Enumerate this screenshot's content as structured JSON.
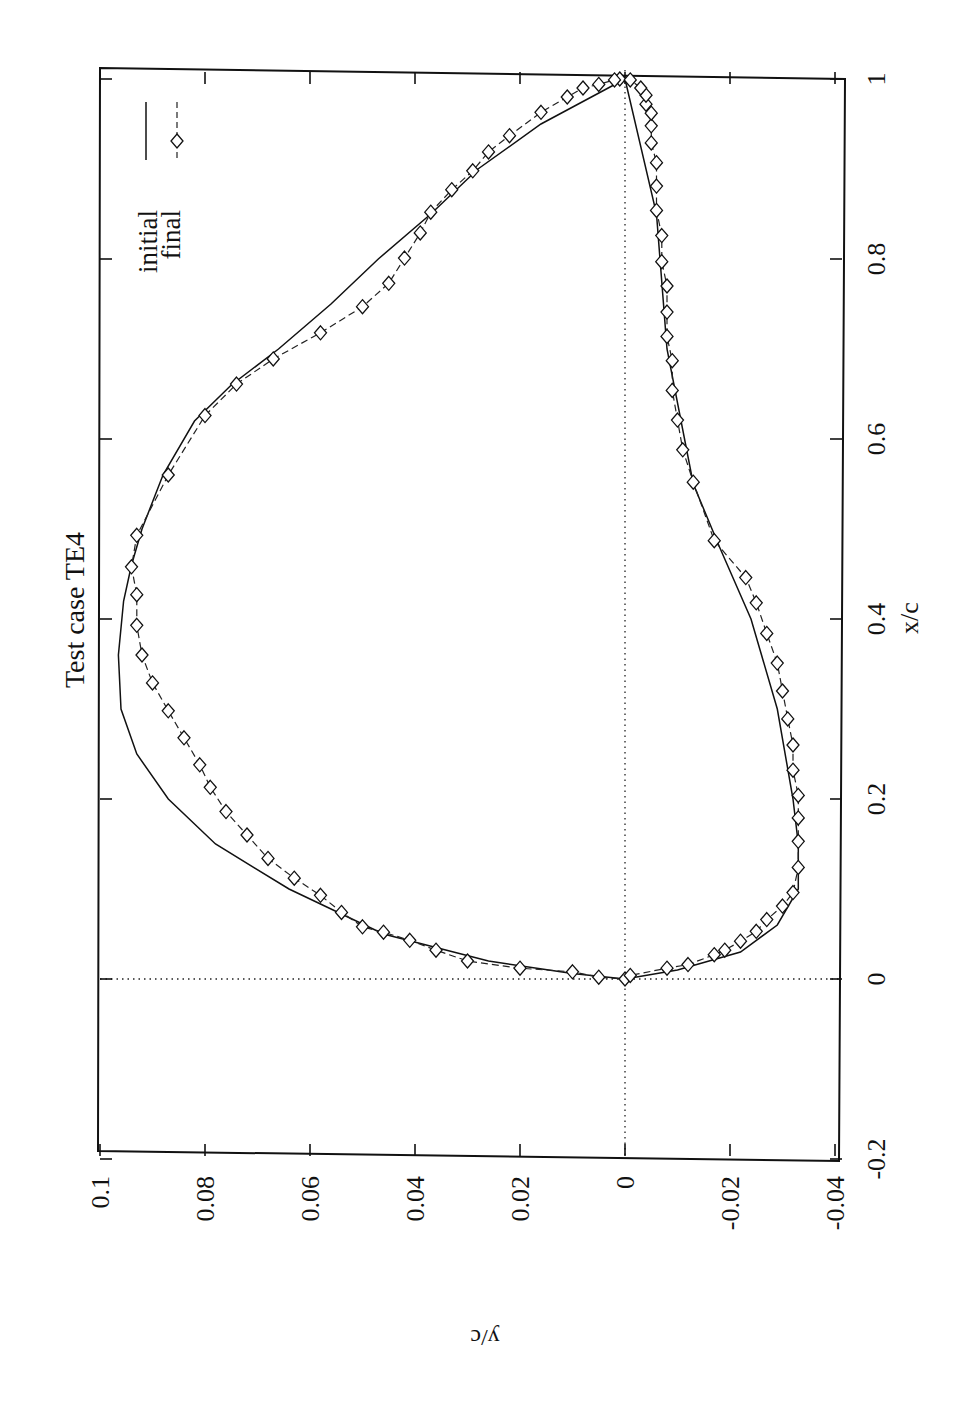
{
  "chart_data": {
    "type": "line",
    "title": "Test case TE4",
    "xlabel": "x/c",
    "ylabel": "y/c",
    "orientation_note": "page is rotated 90 degrees; x/c axis runs vertically on the right edge, y/c axis along the bottom",
    "xlim": [
      -0.2,
      1.0
    ],
    "ylim": [
      -0.04,
      0.1
    ],
    "x_ticks": [
      "-0.2",
      "0",
      "0.2",
      "0.4",
      "0.6",
      "0.8",
      "1"
    ],
    "y_ticks": [
      "0.1",
      "0.08",
      "0.06",
      "0.04",
      "0.02",
      "0",
      "-0.02",
      "-0.04"
    ],
    "x_tick_values": [
      -0.2,
      0,
      0.2,
      0.4,
      0.6,
      0.8,
      1.0
    ],
    "y_tick_values": [
      0.1,
      0.08,
      0.06,
      0.04,
      0.02,
      0,
      -0.02,
      -0.04
    ],
    "grid": false,
    "zero_lines": true,
    "legend": {
      "position": "upper-left (rotated page)",
      "entries": [
        {
          "label": "initial",
          "style": "solid line"
        },
        {
          "label": "final",
          "style": "dashed line with diamond markers"
        }
      ]
    },
    "series": [
      {
        "name": "initial",
        "style": "solid",
        "points": [
          [
            1.0,
            0.0
          ],
          [
            0.95,
            0.016
          ],
          [
            0.9,
            0.028
          ],
          [
            0.85,
            0.037
          ],
          [
            0.8,
            0.047
          ],
          [
            0.75,
            0.056
          ],
          [
            0.7,
            0.066
          ],
          [
            0.66,
            0.075
          ],
          [
            0.62,
            0.082
          ],
          [
            0.56,
            0.088
          ],
          [
            0.5,
            0.092
          ],
          [
            0.46,
            0.094
          ],
          [
            0.42,
            0.0955
          ],
          [
            0.36,
            0.0965
          ],
          [
            0.3,
            0.096
          ],
          [
            0.25,
            0.093
          ],
          [
            0.2,
            0.087
          ],
          [
            0.15,
            0.078
          ],
          [
            0.1,
            0.064
          ],
          [
            0.05,
            0.046
          ],
          [
            0.02,
            0.026
          ],
          [
            0.006,
            0.01
          ],
          [
            0.0,
            0.0
          ],
          [
            0.01,
            -0.01
          ],
          [
            0.03,
            -0.022
          ],
          [
            0.06,
            -0.029
          ],
          [
            0.1,
            -0.033
          ],
          [
            0.15,
            -0.033
          ],
          [
            0.2,
            -0.032
          ],
          [
            0.3,
            -0.029
          ],
          [
            0.4,
            -0.024
          ],
          [
            0.48,
            -0.018
          ],
          [
            0.55,
            -0.013
          ],
          [
            0.7,
            -0.008
          ],
          [
            0.85,
            -0.006
          ],
          [
            1.0,
            0.0
          ]
        ]
      },
      {
        "name": "final",
        "style": "dashed-diamond",
        "points": [
          [
            1.0,
            0.001
          ],
          [
            0.999,
            0.002
          ],
          [
            0.994,
            0.005
          ],
          [
            0.99,
            0.008
          ],
          [
            0.98,
            0.011
          ],
          [
            0.963,
            0.016
          ],
          [
            0.937,
            0.022
          ],
          [
            0.919,
            0.026
          ],
          [
            0.898,
            0.029
          ],
          [
            0.877,
            0.033
          ],
          [
            0.852,
            0.037
          ],
          [
            0.829,
            0.039
          ],
          [
            0.801,
            0.042
          ],
          [
            0.773,
            0.045
          ],
          [
            0.747,
            0.05
          ],
          [
            0.718,
            0.058
          ],
          [
            0.689,
            0.067
          ],
          [
            0.661,
            0.074
          ],
          [
            0.626,
            0.08
          ],
          [
            0.56,
            0.087
          ],
          [
            0.493,
            0.093
          ],
          [
            0.458,
            0.094
          ],
          [
            0.427,
            0.093
          ],
          [
            0.393,
            0.093
          ],
          [
            0.36,
            0.092
          ],
          [
            0.329,
            0.09
          ],
          [
            0.298,
            0.087
          ],
          [
            0.268,
            0.084
          ],
          [
            0.238,
            0.081
          ],
          [
            0.213,
            0.079
          ],
          [
            0.186,
            0.076
          ],
          [
            0.16,
            0.072
          ],
          [
            0.134,
            0.068
          ],
          [
            0.112,
            0.063
          ],
          [
            0.093,
            0.058
          ],
          [
            0.074,
            0.054
          ],
          [
            0.058,
            0.05
          ],
          [
            0.052,
            0.046
          ],
          [
            0.043,
            0.041
          ],
          [
            0.032,
            0.036
          ],
          [
            0.02,
            0.03
          ],
          [
            0.012,
            0.02
          ],
          [
            0.008,
            0.01
          ],
          [
            0.002,
            0.005
          ],
          [
            0.0,
            0.0
          ],
          [
            0.004,
            -0.001
          ],
          [
            0.012,
            -0.008
          ],
          [
            0.016,
            -0.012
          ],
          [
            0.027,
            -0.017
          ],
          [
            0.032,
            -0.019
          ],
          [
            0.042,
            -0.022
          ],
          [
            0.053,
            -0.025
          ],
          [
            0.066,
            -0.027
          ],
          [
            0.081,
            -0.03
          ],
          [
            0.096,
            -0.032
          ],
          [
            0.124,
            -0.033
          ],
          [
            0.153,
            -0.033
          ],
          [
            0.179,
            -0.033
          ],
          [
            0.204,
            -0.033
          ],
          [
            0.232,
            -0.032
          ],
          [
            0.26,
            -0.032
          ],
          [
            0.289,
            -0.031
          ],
          [
            0.32,
            -0.03
          ],
          [
            0.351,
            -0.029
          ],
          [
            0.384,
            -0.027
          ],
          [
            0.418,
            -0.025
          ],
          [
            0.446,
            -0.023
          ],
          [
            0.487,
            -0.017
          ],
          [
            0.552,
            -0.013
          ],
          [
            0.588,
            -0.011
          ],
          [
            0.621,
            -0.01
          ],
          [
            0.654,
            -0.009
          ],
          [
            0.687,
            -0.009
          ],
          [
            0.714,
            -0.008
          ],
          [
            0.741,
            -0.008
          ],
          [
            0.77,
            -0.008
          ],
          [
            0.797,
            -0.007
          ],
          [
            0.826,
            -0.007
          ],
          [
            0.854,
            -0.006
          ],
          [
            0.881,
            -0.006
          ],
          [
            0.907,
            -0.006
          ],
          [
            0.929,
            -0.005
          ],
          [
            0.948,
            -0.005
          ],
          [
            0.962,
            -0.005
          ],
          [
            0.972,
            -0.004
          ],
          [
            0.982,
            -0.004
          ],
          [
            0.99,
            -0.003
          ],
          [
            0.999,
            -0.001
          ]
        ]
      }
    ]
  },
  "labels": {
    "title": "Test case TE4",
    "xlabel": "x/c",
    "ylabel": "y/c",
    "legend_initial": "initial",
    "legend_final": "final"
  }
}
